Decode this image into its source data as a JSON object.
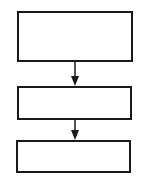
{
  "diagram": {
    "type": "flowchart",
    "direction": "top-to-bottom",
    "line_color": "#1a1a1a",
    "background": "#ffffff",
    "nodes": [
      {
        "id": "box-1",
        "label": ""
      },
      {
        "id": "box-2",
        "label": ""
      },
      {
        "id": "box-3",
        "label": ""
      }
    ],
    "edges": [
      {
        "from": "box-1",
        "to": "box-2"
      },
      {
        "from": "box-2",
        "to": "box-3"
      }
    ]
  }
}
